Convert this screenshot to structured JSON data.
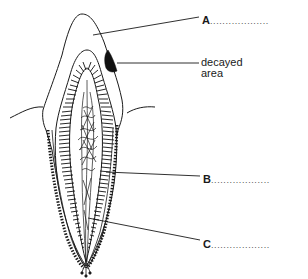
{
  "diagram": {
    "labels": {
      "A": {
        "letter": "A",
        "answer_line": "..................."
      },
      "decayed": {
        "line1": "decayed",
        "line2": "area"
      },
      "B": {
        "letter": "B",
        "answer_line": "..................."
      },
      "C": {
        "letter": "C",
        "answer_line": "..................."
      }
    },
    "colors": {
      "line": "#1a1a1a",
      "background": "#ffffff",
      "decay": "#111111"
    }
  }
}
